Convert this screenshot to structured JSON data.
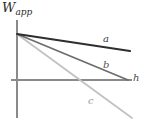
{
  "figure": {
    "name": "work-function-vs-h-plot",
    "background_color": "#ffffff"
  },
  "axes": {
    "y_axis_label": "W",
    "y_axis_label_subscript": "app",
    "x_axis_label": "h",
    "axis_color": "#8a8a8a",
    "origin": {
      "x": 17,
      "y": 80
    },
    "y_top": 20,
    "y_bottom": 118,
    "x_right": 132
  },
  "labels": {
    "a": "a",
    "b": "b",
    "c": "c",
    "h": "h"
  },
  "chart_data": {
    "type": "line",
    "title": "",
    "xlabel": "h",
    "ylabel": "W_app",
    "grid": false,
    "legend": "inline-end-labels",
    "xlim": [
      0,
      128
    ],
    "ylim": [
      -38,
      46
    ],
    "series": [
      {
        "name": "a",
        "color": "#2e2e2e",
        "width": 2.0,
        "x": [
          0,
          113
        ],
        "y": [
          46,
          29
        ],
        "pixel_start": {
          "x": 17,
          "y": 34
        },
        "pixel_end": {
          "x": 130,
          "y": 51
        },
        "slope_sign": "shallow-negative"
      },
      {
        "name": "b",
        "color": "#6b6b6b",
        "width": 1.6,
        "x": [
          0,
          111
        ],
        "y": [
          46,
          0
        ],
        "pixel_start": {
          "x": 17,
          "y": 34
        },
        "pixel_end": {
          "x": 128,
          "y": 80
        },
        "slope_sign": "medium-negative"
      },
      {
        "name": "c",
        "color": "#c2c2c2",
        "width": 1.8,
        "x": [
          0,
          115
        ],
        "y": [
          46,
          -38
        ],
        "pixel_start": {
          "x": 17,
          "y": 34
        },
        "pixel_end": {
          "x": 132,
          "y": 118
        },
        "x_intercept": 58,
        "slope_sign": "steep-negative"
      }
    ]
  }
}
